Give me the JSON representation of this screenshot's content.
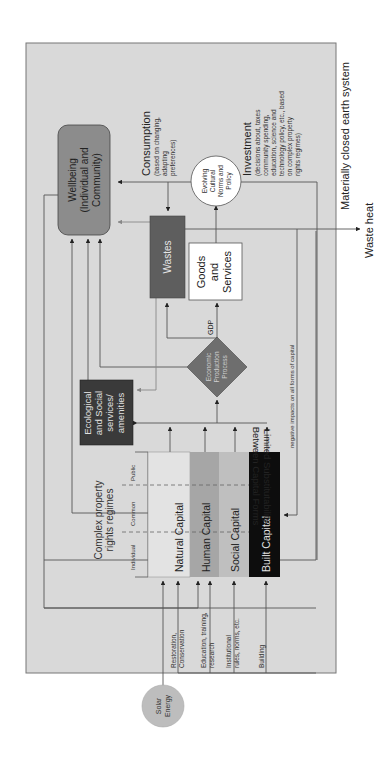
{
  "diagram": {
    "boundary_label": "Materially closed earth system",
    "waste_heat_label": "Waste heat",
    "solar": [
      "Solar",
      "Energy"
    ],
    "wellbeing": [
      "Wellbeing",
      "(Individual and",
      "Community)"
    ],
    "consumption_title": "Consumption",
    "consumption_note": [
      "(based on changing,",
      "adapting",
      "preferences)"
    ],
    "investment_title": "Investment",
    "investment_note": [
      "(decisions about, taxes",
      "community spending,",
      "education, science and",
      "technology policy, etc., based",
      "on complex property",
      "rights regimes)"
    ],
    "norms": [
      "Evolving",
      "Cultural",
      "Norms and",
      "Policy"
    ],
    "wastes": "Wastes",
    "goods": [
      "Goods",
      "and",
      "Services"
    ],
    "gdp": "GDP",
    "production": [
      "Economic",
      "Production",
      "Process"
    ],
    "eco_services": [
      "Ecological",
      "and Social",
      "services/",
      "amenities"
    ],
    "negative_impacts": "negative impacts on all forms of capital",
    "property_title": [
      "Complex property",
      "rights regimes"
    ],
    "property_regimes": [
      "Individual",
      "Common",
      "Public"
    ],
    "capitals": [
      "Natural Capital",
      "Human Capital",
      "Social Capital",
      "Built Capital"
    ],
    "substitutability": [
      "Limited Substitutability",
      "Between Capital Forms"
    ],
    "inputs": [
      [
        "Restoration,",
        "Conservation"
      ],
      [
        "Education, training,",
        "research"
      ],
      [
        "Institutional",
        "rules, norms, etc."
      ],
      [
        "Building"
      ]
    ],
    "colors": {
      "background": "#d9d9d9",
      "wellbeing": "#8c8c8c",
      "wastes": "#5e5e5e",
      "diamond": "#6e6e6e",
      "eco": "#3a3a3a",
      "natural": "#e3e3e3",
      "human": "#a6a6a6",
      "social": "#bfbfbf",
      "built": "#0d0d0d",
      "solar": "#bdbdbd",
      "line": "#555555"
    }
  }
}
